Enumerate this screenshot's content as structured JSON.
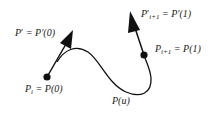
{
  "diagram": {
    "colors": {
      "stroke": "#111111",
      "background": "#ffffff",
      "text": "#222222"
    },
    "curve_label": "P(u)",
    "points": [
      {
        "name": "start-point",
        "label_base": "P",
        "label_sub": "i",
        "label_rest": " = P(0)"
      },
      {
        "name": "end-point",
        "label_base": "P",
        "label_sub": "i+1",
        "label_rest": " = P(1)"
      }
    ],
    "tangents": [
      {
        "name": "start-tangent",
        "label_base": "P",
        "label_prime": "′",
        "label_rest": " = P′(0)"
      },
      {
        "name": "end-tangent",
        "label_base": "P",
        "label_prime": "′",
        "label_sub": "i+1",
        "label_rest": " = P′(1)"
      }
    ]
  }
}
